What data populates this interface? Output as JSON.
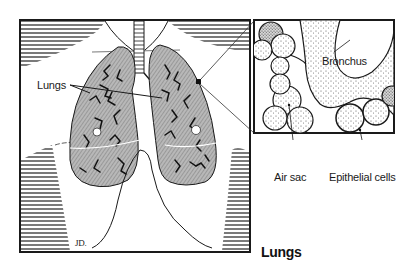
{
  "figure": {
    "caption": "Lungs",
    "signature": "JD.",
    "colors": {
      "lung_fill": "#9a9a9a",
      "outline": "#1a1a1a",
      "stipple": "#8c8c8c",
      "background": "#ffffff"
    }
  },
  "labels": {
    "lungs": "Lungs",
    "bronchus": "Bronchus",
    "air_sac": "Air sac",
    "epithelial_cells": "Epithelial cells"
  }
}
